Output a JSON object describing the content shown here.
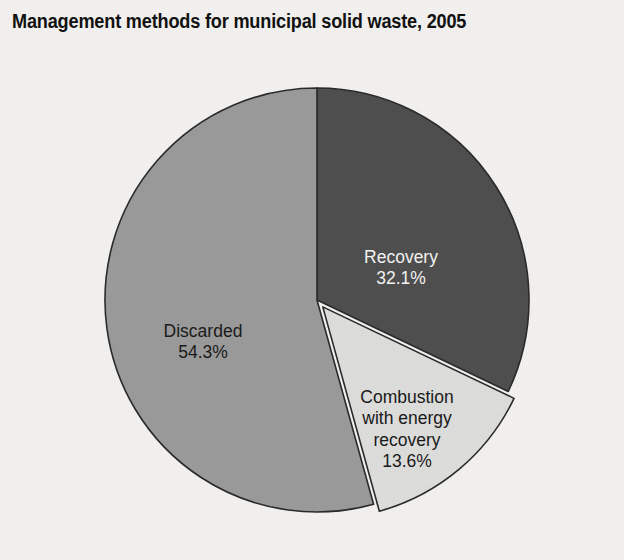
{
  "figure": {
    "title": "Management methods for municipal solid waste, 2005",
    "background_color": "#f3f2f0",
    "title_color": "#121212"
  },
  "chart_data": {
    "type": "pie",
    "title": "Management methods for municipal solid waste, 2005",
    "xlabel": "",
    "ylabel": "",
    "units": "percent",
    "total": 100.0,
    "start_angle_deg": 0,
    "direction": "clockwise",
    "legend": "none",
    "grid": false,
    "categories": [
      "Recovery",
      "Combustion with energy recovery",
      "Discarded"
    ],
    "values": [
      32.1,
      13.6,
      54.3
    ],
    "slices": [
      {
        "name": "Recovery",
        "label_lines": [
          "Recovery",
          "32.1%"
        ],
        "value": 32.1,
        "value_label": "32.1%",
        "color": "#4f4f4f",
        "label_color": "#f4f4f4",
        "start_deg": 0.0,
        "end_deg": 115.56,
        "exploded": false
      },
      {
        "name": "Combustion with energy recovery",
        "label_lines": [
          "Combustion",
          "with energy",
          "recovery",
          "13.6%"
        ],
        "value": 13.6,
        "value_label": "13.6%",
        "color": "#dededc",
        "label_color": "#1a1a1a",
        "start_deg": 115.56,
        "end_deg": 164.52,
        "exploded": true
      },
      {
        "name": "Discarded",
        "label_lines": [
          "Discarded",
          "54.3%"
        ],
        "value": 54.3,
        "value_label": "54.3%",
        "color": "#9b9b9b",
        "label_color": "#1a1a1a",
        "start_deg": 164.52,
        "end_deg": 360.0,
        "exploded": false
      }
    ],
    "outline_color": "#2b2b2b"
  },
  "labels": {
    "recovery": {
      "line1": "Recovery",
      "line2": "32.1%"
    },
    "discarded": {
      "line1": "Discarded",
      "line2": "54.3%"
    },
    "combustion": {
      "line1": "Combustion",
      "line2": "with energy",
      "line3": "recovery",
      "line4": "13.6%"
    }
  }
}
